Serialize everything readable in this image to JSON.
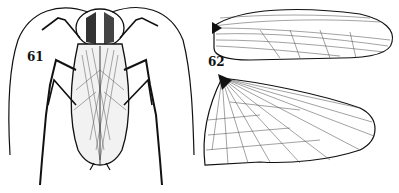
{
  "figures": [
    {
      "number": "61",
      "subject": "cockroach-dorsal-view"
    },
    {
      "number": "62",
      "subject": "cockroach-wings",
      "parts": [
        "forewing",
        "hindwing"
      ]
    }
  ],
  "colors": {
    "ink": "#111111",
    "paper": "#ffffff"
  }
}
